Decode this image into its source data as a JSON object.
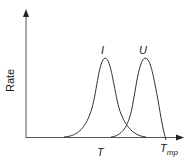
{
  "diagram": {
    "y_axis_label": "Rate",
    "x_axis_label": "T",
    "x_axis_end_label": "T",
    "x_axis_end_subscript": "mp",
    "curves": [
      {
        "label": "I",
        "peak_x": 105,
        "peak_y": 58
      },
      {
        "label": "U",
        "peak_x": 145,
        "peak_y": 58
      }
    ],
    "colors": {
      "line": "#333333",
      "background": "#ffffff"
    }
  }
}
